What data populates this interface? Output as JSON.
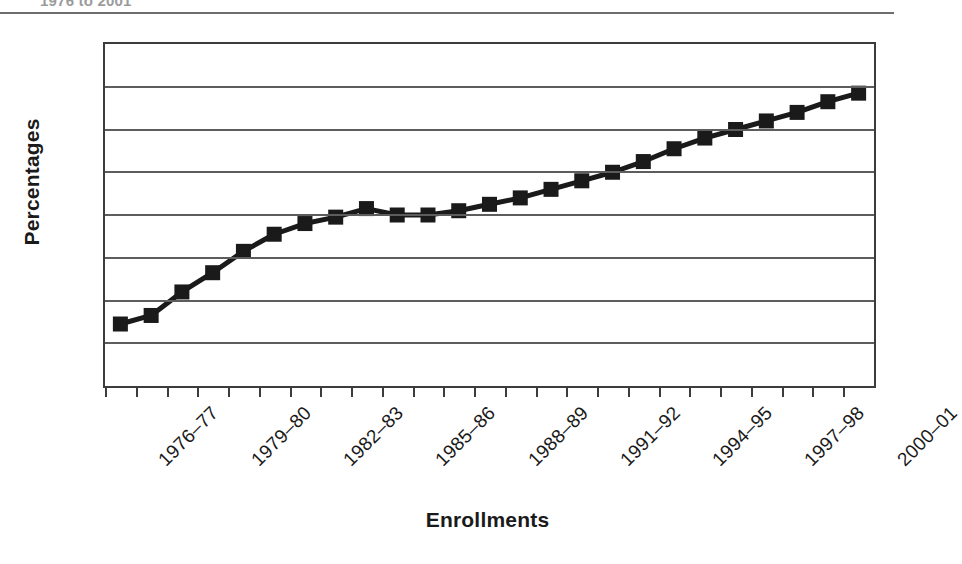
{
  "caption_fragment": "1976 to 2001",
  "chart_data": {
    "type": "line",
    "title": "",
    "subtitle": "",
    "xlabel": "Enrollments",
    "ylabel": "Percentages",
    "ylim": [
      7,
      15
    ],
    "ytick_labels": [
      "15",
      "14",
      "13",
      "12",
      "11",
      "10",
      "9",
      "8",
      "7"
    ],
    "ytick_values": [
      15,
      14,
      13,
      12,
      11,
      10,
      9,
      8,
      7
    ],
    "grid": "horizontal",
    "legend": "none",
    "marker": "square",
    "line_color": "#1a1a1a",
    "marker_color": "#1a1a1a",
    "categories": [
      "1976-77",
      "1977-78",
      "1978-79",
      "1979-80",
      "1980-81",
      "1981-82",
      "1982-83",
      "1983-84",
      "1984-85",
      "1985-86",
      "1986-87",
      "1987-88",
      "1988-89",
      "1989-90",
      "1990-91",
      "1991-92",
      "1992-93",
      "1993-94",
      "1994-95",
      "1995-96",
      "1996-97",
      "1997-98",
      "1998-99",
      "1999-2000",
      "2000-01"
    ],
    "xtick_labels_shown": [
      "1976–77",
      "1979–80",
      "1982–83",
      "1985–86",
      "1988–89",
      "1991–92",
      "1994–95",
      "1997–98",
      "2000–01"
    ],
    "xtick_labeled_indices": [
      0,
      3,
      6,
      9,
      12,
      15,
      18,
      21,
      24
    ],
    "values": [
      8.45,
      8.65,
      9.2,
      9.65,
      10.15,
      10.55,
      10.8,
      10.95,
      11.15,
      11.0,
      11.0,
      11.1,
      11.25,
      11.4,
      11.6,
      11.8,
      12.0,
      12.25,
      12.55,
      12.8,
      13.0,
      13.2,
      13.4,
      13.65,
      13.85
    ]
  }
}
